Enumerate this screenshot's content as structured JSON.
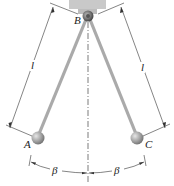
{
  "diagram": {
    "type": "pendulum",
    "points": {
      "pivot": "B",
      "left_bob": "A",
      "right_bob": "C"
    },
    "dimensions": {
      "left_length": "l",
      "right_length": "l",
      "left_angle": "β",
      "right_angle": "β"
    },
    "colors": {
      "rod": "#a9a9a9",
      "bob": "#9a9a9a",
      "support": "#c8c8c8",
      "lines": "#333333"
    }
  }
}
